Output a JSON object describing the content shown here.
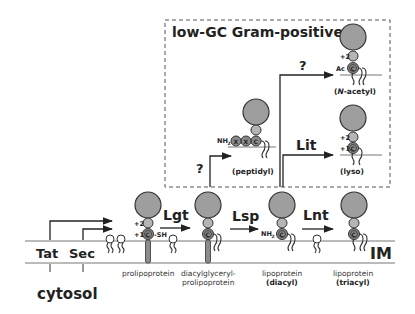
{
  "title": "low-GC Gram-positive",
  "compartments": {
    "membrane": "IM",
    "cytosol": "cytosol"
  },
  "translocases": [
    "Tat",
    "Sec"
  ],
  "enzymes": {
    "lgt": "Lgt",
    "lsp": "Lsp",
    "lnt": "Lnt",
    "lit": "Lit",
    "unknown_peptidyl": "?",
    "unknown_nacetyl": "?"
  },
  "stages": [
    {
      "id": "prolipoprotein",
      "line1": "prolipoprotein",
      "line2": ""
    },
    {
      "id": "diacylglyceryl",
      "line1": "diacylglyceryl-",
      "line2": "prolipoprotein"
    },
    {
      "id": "diacyl",
      "line1": "lipoprotein",
      "line2": "(diacyl)"
    },
    {
      "id": "triacyl",
      "line1": "lipoprotein",
      "line2": "(triacyl)"
    }
  ],
  "gram_positive_forms": [
    {
      "id": "peptidyl",
      "label": "(peptidyl)"
    },
    {
      "id": "nacetyl",
      "label_prefix": "(",
      "label_italic": "N",
      "label_suffix": "-acetyl)"
    },
    {
      "id": "lyso",
      "label": "(lyso)"
    }
  ],
  "residue_labels": {
    "plus2": "+2",
    "plus1": "+1",
    "cys": "C",
    "sh": "-SH",
    "nh2": "NH",
    "nh2_sub": "2",
    "ac": "Ac",
    "x": "X"
  }
}
